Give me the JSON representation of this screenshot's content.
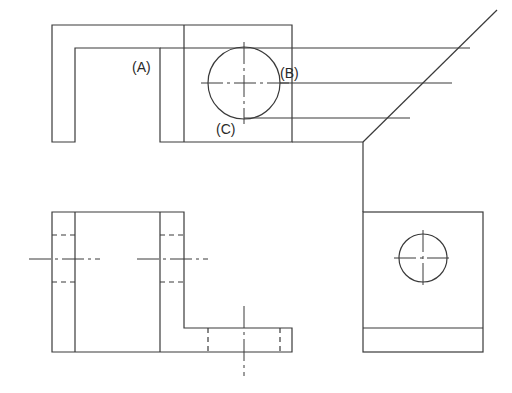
{
  "drawing": {
    "type": "orthographic projection",
    "views": [
      "top-view",
      "front-view",
      "side-view"
    ],
    "stroke_color": "#3a3a3a",
    "background": "#ffffff"
  },
  "labels": {
    "a": "(A)",
    "b": "(B)",
    "c": "(C)"
  }
}
